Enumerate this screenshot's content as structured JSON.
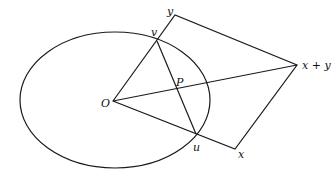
{
  "diagram": {
    "title": "",
    "colors": {
      "stroke": "#1a1a1a",
      "text": "#111111",
      "background": "#ffffff"
    },
    "ellipse": {
      "cx": 115,
      "cy": 100,
      "rx": 95,
      "ry": 68
    },
    "points": {
      "O": [
        113,
        101
      ],
      "v": [
        157,
        41
      ],
      "y": [
        175,
        15
      ],
      "xy": [
        297,
        65
      ],
      "x": [
        235,
        149
      ],
      "u": [
        196,
        134
      ],
      "P": [
        178,
        89
      ]
    },
    "labels": {
      "y": "y",
      "v": "v",
      "P": "P",
      "xy": "x + y",
      "O": "O",
      "u": "u",
      "x": "x"
    }
  }
}
